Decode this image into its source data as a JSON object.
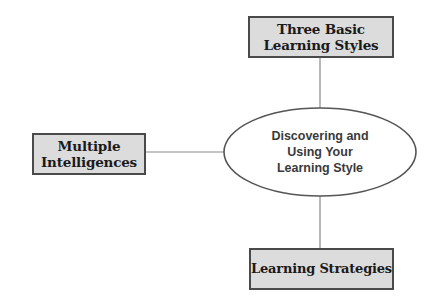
{
  "diagram": {
    "type": "concept-map",
    "center": {
      "label": "Discovering and\nUsing Your\nLearning Style",
      "shape": "ellipse"
    },
    "nodes": [
      {
        "id": "top",
        "label": "Three Basic\nLearning Styles",
        "shape": "rectangle"
      },
      {
        "id": "left",
        "label": "Multiple\nIntelligences",
        "shape": "rectangle"
      },
      {
        "id": "bottom",
        "label": "Learning Strategies",
        "shape": "rectangle"
      }
    ],
    "edges": [
      {
        "from": "center",
        "to": "top"
      },
      {
        "from": "center",
        "to": "left"
      },
      {
        "from": "center",
        "to": "bottom"
      }
    ],
    "colors": {
      "box_fill": "#dcdcdc",
      "box_border": "#4a4a4a",
      "connector": "#8a8a8a",
      "ellipse_border": "#555555",
      "box_text": "#1a1a1a",
      "center_text": "#3a3a3a"
    }
  }
}
